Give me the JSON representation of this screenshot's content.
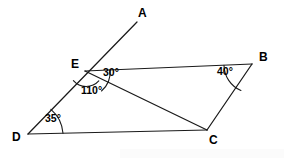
{
  "figure": {
    "type": "geometry-diagram",
    "background_color": "#ffffff",
    "stroke_color": "#1a1a1a",
    "text_color": "#000000"
  },
  "points": {
    "A": {
      "label": "A",
      "x": 137,
      "y": 22,
      "label_x": 138,
      "label_y": 7
    },
    "B": {
      "label": "B",
      "x": 252,
      "y": 64,
      "label_x": 259,
      "label_y": 51
    },
    "C": {
      "label": "C",
      "x": 207,
      "y": 130,
      "label_x": 209,
      "label_y": 134
    },
    "D": {
      "label": "D",
      "x": 28,
      "y": 134,
      "label_x": 12,
      "label_y": 131
    },
    "E": {
      "label": "E",
      "x": 85,
      "y": 71,
      "label_x": 71,
      "label_y": 58
    }
  },
  "segments": [
    {
      "name": "ray-D-through-E-to-A",
      "from": "D",
      "to": "A"
    },
    {
      "name": "segment-E-B",
      "from": "E",
      "to": "B"
    },
    {
      "name": "segment-E-C",
      "from": "E",
      "to": "C"
    },
    {
      "name": "segment-D-C",
      "from": "D",
      "to": "C"
    },
    {
      "name": "segment-B-C",
      "from": "B",
      "to": "C"
    }
  ],
  "angles": [
    {
      "name": "angle-BEC",
      "vertex": "E",
      "value": "30°",
      "label_x": 103,
      "label_y": 67
    },
    {
      "name": "angle-DEC",
      "vertex": "E",
      "value": "110°",
      "label_x": 81,
      "label_y": 85
    },
    {
      "name": "angle-EDC",
      "vertex": "D",
      "value": "35°",
      "label_x": 45,
      "label_y": 113
    },
    {
      "name": "angle-EBC",
      "vertex": "B",
      "value": "40°",
      "label_x": 217,
      "label_y": 66
    }
  ]
}
